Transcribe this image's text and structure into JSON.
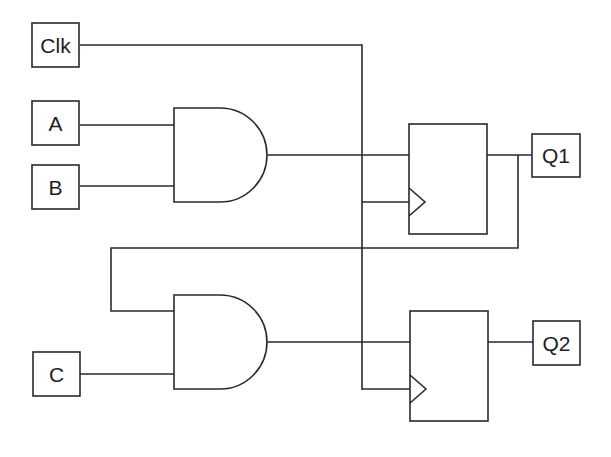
{
  "diagram": {
    "type": "logic-circuit",
    "stroke_color": "#2a2a2a",
    "background": "#ffffff",
    "inputs": [
      {
        "id": "clk",
        "label": "Clk"
      },
      {
        "id": "a",
        "label": "A"
      },
      {
        "id": "b",
        "label": "B"
      },
      {
        "id": "c",
        "label": "C"
      }
    ],
    "outputs": [
      {
        "id": "q1",
        "label": "Q1"
      },
      {
        "id": "q2",
        "label": "Q2"
      }
    ],
    "gates": [
      {
        "id": "and1",
        "type": "AND",
        "inputs": [
          "A",
          "B"
        ],
        "output": "FF1.D"
      },
      {
        "id": "and2",
        "type": "AND",
        "inputs": [
          "Q1 (feedback)",
          "C"
        ],
        "output": "FF2.D"
      }
    ],
    "flip_flops": [
      {
        "id": "ff1",
        "type": "D",
        "d": "and1",
        "clk": "Clk",
        "q": "Q1"
      },
      {
        "id": "ff2",
        "type": "D",
        "d": "and2",
        "clk": "Clk",
        "q": "Q2"
      }
    ]
  }
}
